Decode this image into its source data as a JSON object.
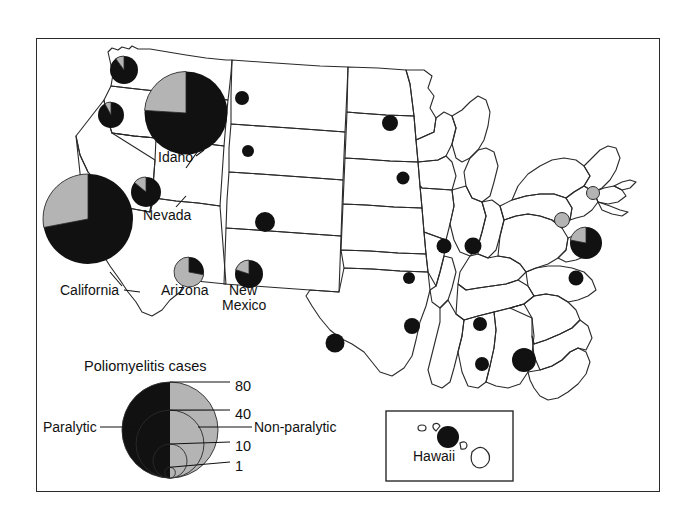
{
  "figure": {
    "type": "choropleth-proportional-symbol-map",
    "region": "United States",
    "frame": {
      "x": 36,
      "y": 38,
      "w": 624,
      "h": 454
    }
  },
  "legend": {
    "title": "Poliomyelitis cases",
    "left_label": "Paralytic",
    "right_label": "Non-paralytic",
    "left_color": "#111111",
    "right_color": "#b4b4b4",
    "size_ticks": [
      {
        "label": "80",
        "value": 80
      },
      {
        "label": "40",
        "value": 40
      },
      {
        "label": "10",
        "value": 10
      },
      {
        "label": "1",
        "value": 1
      }
    ]
  },
  "inset": {
    "label": "Hawaii",
    "box": {
      "x": 386,
      "y": 411,
      "w": 127,
      "h": 70
    }
  },
  "callouts": [
    {
      "label": "Idaho",
      "x": 158,
      "y": 157
    },
    {
      "label": "Nevada",
      "x": 143,
      "y": 215
    },
    {
      "label": "California",
      "x": 62,
      "y": 290
    },
    {
      "label": "Arizona",
      "x": 163,
      "y": 292
    },
    {
      "label": "New",
      "x": 229,
      "y": 292
    },
    {
      "label": "Mexico",
      "x": 224,
      "y": 307
    }
  ],
  "chart_data": {
    "type": "scatter",
    "title": "Poliomyelitis cases",
    "encoding": "circle area proportional to total cases; black = paralytic, gray = non-paralytic",
    "size_scale": {
      "ticks": [
        1,
        10,
        40,
        80
      ],
      "units": "cases"
    },
    "colors": {
      "paralytic": "#111111",
      "non_paralytic": "#b4b4b4",
      "outline": "#2a2a2a"
    },
    "points": [
      {
        "state": "Washington",
        "cx": 124,
        "cy": 70,
        "r": 14,
        "paralytic_frac": 0.9
      },
      {
        "state": "Oregon",
        "cx": 111,
        "cy": 115,
        "r": 13,
        "paralytic_frac": 0.92
      },
      {
        "state": "Idaho",
        "cx": 186,
        "cy": 113,
        "r": 41.5,
        "paralytic_frac": 0.76
      },
      {
        "state": "California",
        "cx": 88,
        "cy": 219,
        "r": 45,
        "paralytic_frac": 0.72
      },
      {
        "state": "Nevada",
        "cx": 146,
        "cy": 192,
        "r": 15,
        "paralytic_frac": 0.86
      },
      {
        "state": "Montana",
        "cx": 242,
        "cy": 98,
        "r": 7,
        "paralytic_frac": 1.0
      },
      {
        "state": "Wyoming",
        "cx": 248,
        "cy": 151,
        "r": 6,
        "paralytic_frac": 1.0
      },
      {
        "state": "Colorado",
        "cx": 265,
        "cy": 222,
        "r": 10,
        "paralytic_frac": 1.0
      },
      {
        "state": "Arizona",
        "cx": 189,
        "cy": 272,
        "r": 15,
        "paralytic_frac": 0.28
      },
      {
        "state": "New Mexico",
        "cx": 249,
        "cy": 274,
        "r": 14,
        "paralytic_frac": 0.8
      },
      {
        "state": "Texas",
        "cx": 335,
        "cy": 343,
        "r": 9.5,
        "paralytic_frac": 1.0
      },
      {
        "state": "Minnesota",
        "cx": 390,
        "cy": 123,
        "r": 8,
        "paralytic_frac": 1.0
      },
      {
        "state": "Iowa",
        "cx": 403,
        "cy": 178,
        "r": 6.5,
        "paralytic_frac": 1.0
      },
      {
        "state": "Illinois",
        "cx": 444,
        "cy": 246,
        "r": 7.5,
        "paralytic_frac": 1.0
      },
      {
        "state": "Indiana",
        "cx": 473,
        "cy": 246,
        "r": 8.5,
        "paralytic_frac": 1.0
      },
      {
        "state": "Missouri",
        "cx": 409,
        "cy": 278,
        "r": 6,
        "paralytic_frac": 1.0
      },
      {
        "state": "Tennessee",
        "cx": 480,
        "cy": 324,
        "r": 7,
        "paralytic_frac": 1.0
      },
      {
        "state": "Mississippi",
        "cx": 412,
        "cy": 326,
        "r": 8,
        "paralytic_frac": 1.0
      },
      {
        "state": "Alabama",
        "cx": 482,
        "cy": 364,
        "r": 7,
        "paralytic_frac": 1.0
      },
      {
        "state": "Georgia",
        "cx": 524,
        "cy": 360,
        "r": 12,
        "paralytic_frac": 1.0
      },
      {
        "state": "Virginia",
        "cx": 576,
        "cy": 278,
        "r": 7.5,
        "paralytic_frac": 1.0
      },
      {
        "state": "New York",
        "cx": 562,
        "cy": 220,
        "r": 7.5,
        "paralytic_frac": 0.0
      },
      {
        "state": "Connecticut",
        "cx": 593,
        "cy": 193,
        "r": 6.5,
        "paralytic_frac": 0.0
      },
      {
        "state": "Delaware",
        "cx": 586,
        "cy": 243,
        "r": 16,
        "paralytic_frac": 0.78
      },
      {
        "state": "Hawaii",
        "cx": 448,
        "cy": 437,
        "r": 11,
        "paralytic_frac": 1.0
      }
    ]
  }
}
